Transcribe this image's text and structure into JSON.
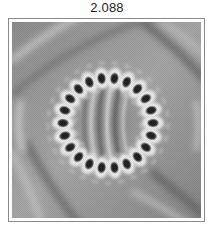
{
  "figure": {
    "title": "2.088",
    "colormap": "grayscale",
    "colors": {
      "background_mid_gray": "#9a9a9a",
      "lobe_dark": "#1e1e1e",
      "lobe_halo": "#5a5a5a",
      "fringe_light": "#f2f2f2",
      "frame_border": "#8a8a8a"
    },
    "pattern": {
      "description": "ring of dark elliptical lobes with bright fringes, curved vertical bands in center, diagonal wave texture in background",
      "lobe_count": 22,
      "ring_center_px": [
        107,
        122
      ],
      "ring_radius_px": 45
    }
  }
}
